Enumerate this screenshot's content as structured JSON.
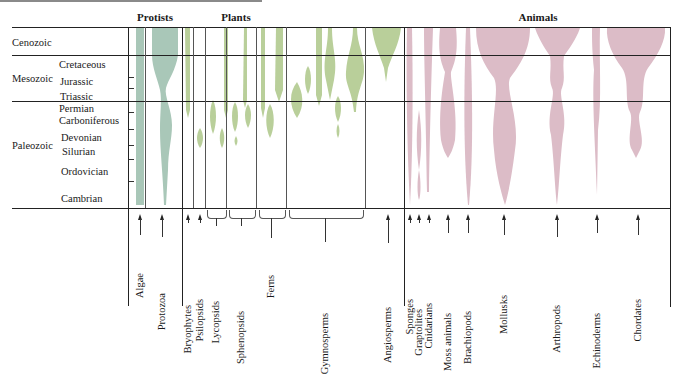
{
  "groups": {
    "protists": "Protists",
    "plants": "Plants",
    "animals": "Animals"
  },
  "eras": {
    "cenozoic": "Cenozoic",
    "mesozoic": "Mesozoic",
    "paleozoic": "Paleozoic"
  },
  "periods": {
    "cretaceous": "Cretaceous",
    "jurassic": "Jurassic",
    "triassic": "Triassic",
    "permian": "Permian",
    "carboniferous": "Carboniferous",
    "devonian": "Devonian",
    "silurian": "Silurian",
    "ordovician": "Ordovician",
    "cambrian": "Cambrian"
  },
  "taxa": {
    "algae": "Algae",
    "protozoa": "Protozoa",
    "bryophytes": "Bryophytes",
    "psilopsids": "Psilopsids",
    "lycopsids": "Lycopsids",
    "sphenopsids": "Sphenopsids",
    "ferns": "Ferns",
    "gymnosperms": "Gymnosperms",
    "angiosperms": "Angiosperms",
    "sponges": "Sponges",
    "graptolites": "Graptolites",
    "cnidarians": "Cnidarians",
    "moss_animals": "Moss animals",
    "brachiopods": "Brachiopods",
    "mollusks": "Mollusks",
    "arthropods": "Arthropods",
    "echinoderms": "Echinoderms",
    "chordates": "Chordates"
  },
  "colors": {
    "protists": "#a9c7b8",
    "plants": "#b9cf9a",
    "animals": "#dcbcc7",
    "lines": "#222222"
  }
}
